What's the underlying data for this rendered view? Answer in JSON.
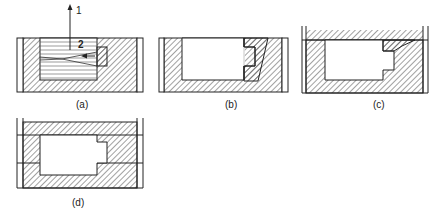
{
  "figure": {
    "colors": {
      "line": "#222222",
      "hatch": "#444444",
      "background": "#ffffff"
    },
    "panels": [
      {
        "id": "a",
        "label": "(a)",
        "annotations": [
          {
            "text": "1",
            "meaning": "pattern withdrawal direction arrow"
          },
          {
            "text": "2",
            "meaning": "loose piece withdrawal arrow"
          }
        ]
      },
      {
        "id": "b",
        "label": "(b)"
      },
      {
        "id": "c",
        "label": "(c)"
      },
      {
        "id": "d",
        "label": "(d)"
      }
    ]
  }
}
